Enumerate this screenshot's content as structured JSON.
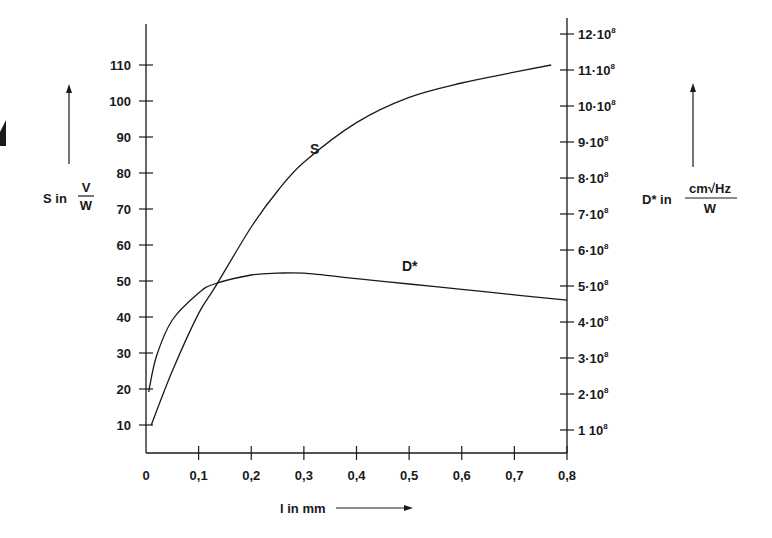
{
  "chart_data": {
    "type": "line",
    "title": "",
    "xlabel": "l in mm",
    "ylabel_left": "S in V/W",
    "ylabel_right": "D* in cm√Hz/W",
    "xlim": [
      0,
      0.8
    ],
    "ylim_left": [
      0,
      120
    ],
    "ylim_right": [
      0,
      12
    ],
    "grid": false,
    "x_ticks": [
      "0",
      "0,1",
      "0,2",
      "0,3",
      "0,4",
      "0,5",
      "0,6",
      "0,7",
      "0,8"
    ],
    "y_left_ticks": [
      "10",
      "20",
      "30",
      "40",
      "50",
      "60",
      "70",
      "80",
      "90",
      "100",
      "110"
    ],
    "y_right_ticks": [
      "1 10^8",
      "2·10^8",
      "3·10^8",
      "4·10^8",
      "5·10^8",
      "6·10^8",
      "7·10^8",
      "8·10^8",
      "9·10^8",
      "10·10^8",
      "11·10^8",
      "12·10^8"
    ],
    "series": [
      {
        "name": "S",
        "axis": "left",
        "unit": "V/W",
        "x": [
          0.01,
          0.05,
          0.1,
          0.13,
          0.2,
          0.25,
          0.3,
          0.4,
          0.5,
          0.6,
          0.7,
          0.77
        ],
        "values": [
          10,
          25,
          41,
          48,
          65,
          75,
          83,
          94,
          101,
          105,
          108,
          110
        ]
      },
      {
        "name": "D*",
        "axis": "right",
        "unit": "cm√Hz/W",
        "scale": "1e8",
        "x": [
          0.005,
          0.02,
          0.05,
          0.1,
          0.13,
          0.2,
          0.25,
          0.3,
          0.4,
          0.5,
          0.6,
          0.7,
          0.8
        ],
        "values": [
          2.0,
          3.0,
          4.0,
          4.75,
          5.0,
          5.25,
          5.3,
          5.3,
          5.15,
          5.0,
          4.85,
          4.7,
          4.55
        ]
      }
    ],
    "annotations": [
      "S",
      "D*"
    ]
  },
  "labels": {
    "s_axis_prefix": "S in",
    "s_unit_num": "V",
    "s_unit_den": "W",
    "d_axis_prefix": "D* in",
    "d_unit_num": "cm√Hz",
    "d_unit_den": "W",
    "x_axis": "l in mm",
    "curve_s": "S",
    "curve_d": "D*"
  }
}
